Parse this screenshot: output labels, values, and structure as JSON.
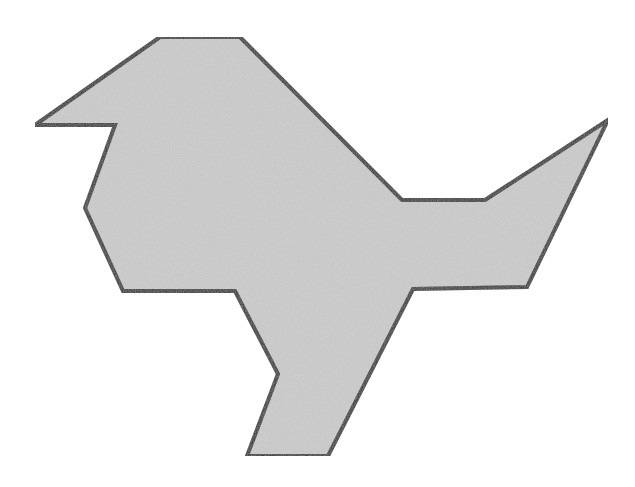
{
  "figure": {
    "fill_color": "#c4c4c4",
    "stroke_color": "#2a2a2a",
    "stroke_width": 4,
    "background": "#ffffff",
    "outline_points": "35,125 160,37 240,37 402,200 485,200 608,120 527,287 413,289 328,456 247,456 278,374 235,291 123,291 85,208 115,125"
  }
}
